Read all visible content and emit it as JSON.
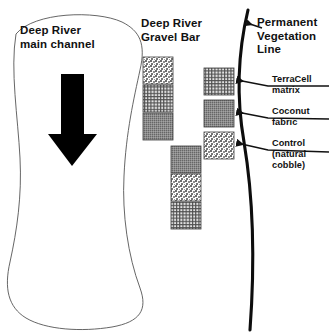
{
  "figure": {
    "type": "plan-view-site-diagram",
    "background_color": "#ffffff",
    "line_color": "#3a3a3a",
    "ink_color": "#111111"
  },
  "labels": {
    "river_channel": "Deep River\nmain channel",
    "river_channel_line1": "Deep River",
    "river_channel_line2": "main channel",
    "gravel_bar_line1": "Deep River",
    "gravel_bar_line2": "Gravel Bar",
    "vegetation_line1": "Permanent",
    "vegetation_line2": "Vegetation",
    "vegetation_line3": "Line",
    "terracell_line1": "TerraCell",
    "terracell_line2": "matrix",
    "coconut_line1": "Coconut",
    "coconut_line2": "fabric",
    "control_line1": "Control",
    "control_line2": "(natural",
    "control_line3": "cobble)"
  },
  "flow_arrow": {
    "name": "flow-direction-arrow",
    "direction": "downstream",
    "color": "#000000"
  },
  "treatments": [
    {
      "key": "terracell",
      "label": "TerraCell matrix",
      "texture": "grid-mesh",
      "fill": "#8a8a8a"
    },
    {
      "key": "coconut",
      "label": "Coconut fabric",
      "texture": "fine-speckle",
      "fill": "#7e7e7e"
    },
    {
      "key": "control",
      "label": "Control (natural cobble)",
      "texture": "coarse-stipple",
      "fill": "#9a9a9a"
    }
  ],
  "plots": {
    "column_left": [
      {
        "treatment": "control",
        "x": 143,
        "y": 57,
        "w": 30,
        "h": 27
      },
      {
        "treatment": "terracell",
        "x": 143,
        "y": 85,
        "w": 30,
        "h": 27
      },
      {
        "treatment": "coconut",
        "x": 143,
        "y": 113,
        "w": 30,
        "h": 27
      }
    ],
    "column_middle": [
      {
        "treatment": "coconut",
        "x": 171,
        "y": 146,
        "w": 30,
        "h": 27
      },
      {
        "treatment": "control",
        "x": 171,
        "y": 174,
        "w": 30,
        "h": 27
      },
      {
        "treatment": "terracell",
        "x": 171,
        "y": 202,
        "w": 30,
        "h": 27
      }
    ],
    "column_right": [
      {
        "treatment": "terracell",
        "x": 204,
        "y": 68,
        "w": 30,
        "h": 27
      },
      {
        "treatment": "coconut",
        "x": 204,
        "y": 100,
        "w": 30,
        "h": 27
      },
      {
        "treatment": "control",
        "x": 204,
        "y": 132,
        "w": 30,
        "h": 27
      }
    ]
  },
  "leaders": [
    {
      "name": "leader-vegetation-line",
      "target": "vegetation-curve"
    },
    {
      "name": "leader-terracell",
      "target": "plot-right-1"
    },
    {
      "name": "leader-coconut",
      "target": "plot-right-2"
    },
    {
      "name": "leader-control",
      "target": "plot-right-3"
    }
  ]
}
